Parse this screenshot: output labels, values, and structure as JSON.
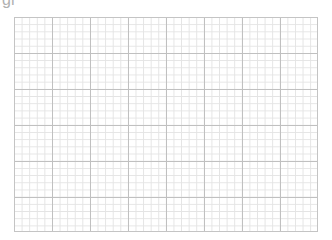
{
  "header": {
    "title_fragment": "gr"
  },
  "grid": {
    "major_columns": 8,
    "major_rows": 6,
    "minor_per_major": 5,
    "colors": {
      "major_line": "#c0c0c0",
      "minor_line": "#e4e4e4",
      "background": "#ffffff"
    }
  }
}
